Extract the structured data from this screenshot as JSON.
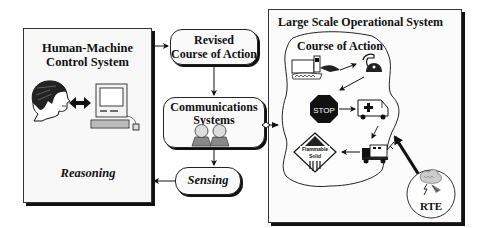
{
  "diagram": {
    "left_panel": {
      "title_line1": "Human-Machine",
      "title_line2": "Control System",
      "label": "Reasoning",
      "icons": [
        "human-head-icon",
        "bidirectional-arrow-icon",
        "desktop-computer-icon"
      ]
    },
    "revised_course": {
      "line1": "Revised",
      "line2": "Course of Action"
    },
    "communications": {
      "line1": "Communications",
      "line2": "Systems",
      "icons": [
        "person-silhouette-icon",
        "person-silhouette-icon"
      ]
    },
    "sensing": {
      "label": "Sensing"
    },
    "right_panel": {
      "title": "Large Scale Operational System",
      "region_label": "Course of Action",
      "icons": [
        "truck-accident-icon",
        "telephone-icon",
        "stop-sign-icon",
        "ambulance-icon",
        "tow-truck-icon",
        "hazmat-placard-icon"
      ],
      "stop_text": "STOP",
      "hazmat_text_line1": "Flammable",
      "hazmat_text_line2": "Solid",
      "rte_label": "RTE"
    },
    "connections": [
      {
        "from": "Human-Machine Control System",
        "to": "Revised Course of Action"
      },
      {
        "from": "Revised Course of Action",
        "to": "Communications Systems"
      },
      {
        "from": "Communications Systems",
        "to": "Large Scale Operational System",
        "bidirectional": true
      },
      {
        "from": "Communications Systems",
        "to": "Sensing"
      },
      {
        "from": "Sensing",
        "to": "Human-Machine Control System"
      },
      {
        "from": "RTE",
        "to": "Course of Action"
      }
    ]
  }
}
